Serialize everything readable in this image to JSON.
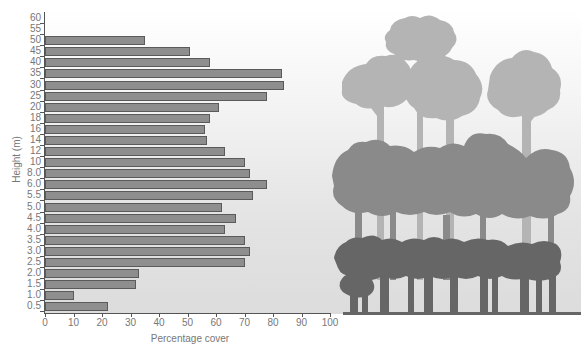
{
  "chart_data": {
    "type": "bar",
    "orientation": "horizontal",
    "title": "",
    "xlabel": "Percentage cover",
    "ylabel": "Height (m)",
    "xlim": [
      0,
      100
    ],
    "x_ticks": [
      "0",
      "10",
      "20",
      "30",
      "40",
      "50",
      "60",
      "70",
      "80",
      "90",
      "100"
    ],
    "y_tick_labels": [
      "60",
      "55",
      "50",
      "45",
      "40",
      "35",
      "30",
      "25",
      "20",
      "18",
      "16",
      "14",
      "12",
      "10",
      "8.0",
      "6.0",
      "5.5",
      "5.0",
      "4.5",
      "4.0",
      "3.5",
      "3.0",
      "2.5",
      "2.0",
      "1.5",
      "1.0",
      "0.5"
    ],
    "categories": [
      "50",
      "45",
      "40",
      "35",
      "30",
      "25",
      "20",
      "18",
      "16",
      "14",
      "12",
      "10",
      "8.0",
      "6.0",
      "5.5",
      "5.0",
      "4.5",
      "4.0",
      "3.5",
      "3.0",
      "2.5",
      "2.0",
      "1.5",
      "1.0",
      "0.5"
    ],
    "values": [
      35,
      51,
      58,
      83,
      84,
      78,
      61,
      58,
      56,
      57,
      63,
      70,
      72,
      78,
      73,
      62,
      67,
      63,
      70,
      72,
      70,
      33,
      32,
      10,
      22
    ],
    "grid": false,
    "legend": null,
    "annotations": [
      "Forest profile silhouette illustrating canopy layers at right"
    ],
    "bar_color": "#8e8e8e"
  },
  "illustration": {
    "name": "rainforest-stratification-silhouette",
    "layers": [
      {
        "name": "emergent-layer",
        "color": "#b4b4b4"
      },
      {
        "name": "canopy-layer",
        "color": "#8a8a8a"
      },
      {
        "name": "understory-layer",
        "color": "#666666"
      }
    ],
    "ground_color": "#6e6e6e"
  }
}
